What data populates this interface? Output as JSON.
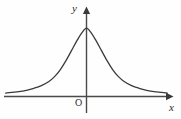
{
  "figure": {
    "kind": "cartesian-plot",
    "background_color": "#fefefe",
    "stroke_color": "#3a3a3a",
    "axis_color": "#4a4a4a",
    "width": 181,
    "height": 119,
    "labels": {
      "y_axis": "y",
      "x_axis": "x",
      "origin": "O"
    }
  },
  "chart_data": {
    "type": "line",
    "title": "",
    "subtitle": "",
    "xlabel": "x",
    "ylabel": "y",
    "origin_label": "O",
    "grid": false,
    "legend": null,
    "legend_position": "none",
    "axis_arrows": {
      "x_axis_right": true,
      "y_axis_top": true
    },
    "axis_ranges": {
      "xlim": [
        -4.3,
        4.8
      ],
      "ylim": [
        -0.22,
        1.25
      ]
    },
    "tick_labels": {
      "x": [],
      "y": []
    },
    "annotations": [
      {
        "text": "O",
        "x": -0.35,
        "y": -0.13,
        "note": "origin marker below x-axis, left of y-axis"
      },
      {
        "text": "y",
        "x": -0.45,
        "y": 1.22,
        "note": "y-axis label at top-left of vertical axis"
      },
      {
        "text": "x",
        "x": 4.55,
        "y": -0.14,
        "note": "x-axis label at right end below arrow"
      }
    ],
    "series": [
      {
        "name": "bell curve",
        "color": "#3a3a3a",
        "style": "solid",
        "x": [
          -4.3,
          -4.0,
          -3.6,
          -3.2,
          -2.8,
          -2.4,
          -2.0,
          -1.7,
          -1.4,
          -1.1,
          -0.8,
          -0.5,
          -0.25,
          0.0,
          0.25,
          0.5,
          0.8,
          1.1,
          1.4,
          1.7,
          2.0,
          2.4,
          2.8,
          3.2,
          3.6,
          4.0,
          4.3
        ],
        "y": [
          0.05,
          0.06,
          0.07,
          0.09,
          0.12,
          0.16,
          0.22,
          0.29,
          0.39,
          0.52,
          0.67,
          0.82,
          0.93,
          1.0,
          0.93,
          0.82,
          0.67,
          0.52,
          0.39,
          0.29,
          0.22,
          0.16,
          0.12,
          0.09,
          0.07,
          0.06,
          0.05
        ]
      }
    ]
  }
}
